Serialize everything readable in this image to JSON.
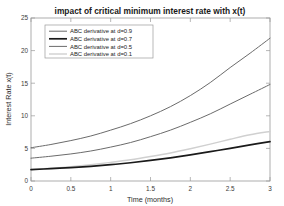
{
  "chart_data": {
    "type": "line",
    "title": "impact of critical minimum interest rate with x(t)",
    "xlabel": "Time (months)",
    "ylabel": "Interest Rate x(t)",
    "xlim": [
      0,
      3
    ],
    "ylim": [
      0,
      25
    ],
    "xticks": [
      "0",
      "0.5",
      "1",
      "1.5",
      "2",
      "2.5",
      "3"
    ],
    "xtick_values": [
      0,
      0.5,
      1,
      1.5,
      2,
      2.5,
      3
    ],
    "yticks": [
      "0",
      "5",
      "10",
      "15",
      "20",
      "25"
    ],
    "ytick_values": [
      0,
      5,
      10,
      15,
      20,
      25
    ],
    "grid": false,
    "legend_position": "upper left",
    "x": [
      0,
      0.25,
      0.5,
      0.75,
      1,
      1.25,
      1.5,
      1.75,
      2,
      2.25,
      2.5,
      2.75,
      3
    ],
    "series": [
      {
        "name": "ABC derivative at d=0.9",
        "color": "#6b6b6b",
        "width": 1.0,
        "values": [
          5.1,
          5.6,
          6.2,
          6.9,
          7.8,
          8.8,
          10.0,
          11.4,
          13.1,
          15.1,
          17.4,
          19.6,
          21.9
        ]
      },
      {
        "name": "ABC derivative at d=0.7",
        "color": "#1a1a1a",
        "width": 1.7,
        "values": [
          1.75,
          1.9,
          2.05,
          2.25,
          2.5,
          2.8,
          3.15,
          3.55,
          4.0,
          4.5,
          5.0,
          5.55,
          6.05
        ]
      },
      {
        "name": "ABC derivative at d=0.5",
        "color": "#6b6b6b",
        "width": 1.0,
        "values": [
          3.5,
          3.8,
          4.15,
          4.6,
          5.2,
          5.9,
          6.8,
          7.8,
          9.0,
          10.3,
          11.8,
          13.3,
          14.8
        ]
      },
      {
        "name": "ABC derivative at d=0.1",
        "color": "#d0d0d0",
        "width": 1.4,
        "values": [
          1.75,
          1.95,
          2.2,
          2.5,
          2.85,
          3.25,
          3.75,
          4.3,
          4.95,
          5.65,
          6.4,
          7.1,
          7.6
        ]
      }
    ]
  }
}
